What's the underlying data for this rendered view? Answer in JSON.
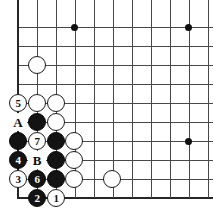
{
  "diagram": {
    "kind": "go-board-diagram",
    "board": {
      "origin_x": 18,
      "origin_y": 27,
      "spacing": 19,
      "cols": 11,
      "rows": 10,
      "left_edge_is_board_border": true,
      "bottom_edge_is_board_border": true,
      "line_color": "#484848",
      "edge_color": "#262626",
      "background_color": "#ffffff"
    },
    "star_points": [
      {
        "x": 74,
        "y": 27
      },
      {
        "x": 188,
        "y": 27
      },
      {
        "x": 188,
        "y": 141
      }
    ],
    "stones": [
      {
        "x": 37,
        "y": 65,
        "color": "white",
        "label": ""
      },
      {
        "x": 18,
        "y": 103,
        "color": "white",
        "label": "5"
      },
      {
        "x": 37,
        "y": 103,
        "color": "white",
        "label": ""
      },
      {
        "x": 56,
        "y": 103,
        "color": "white",
        "label": ""
      },
      {
        "x": 37,
        "y": 122,
        "color": "black",
        "label": ""
      },
      {
        "x": 56,
        "y": 122,
        "color": "white",
        "label": ""
      },
      {
        "x": 18,
        "y": 141,
        "color": "black",
        "label": ""
      },
      {
        "x": 37,
        "y": 141,
        "color": "white",
        "label": "7"
      },
      {
        "x": 56,
        "y": 141,
        "color": "black",
        "label": ""
      },
      {
        "x": 74,
        "y": 141,
        "color": "white",
        "label": ""
      },
      {
        "x": 18,
        "y": 160,
        "color": "black",
        "label": "4"
      },
      {
        "x": 56,
        "y": 160,
        "color": "black",
        "label": ""
      },
      {
        "x": 74,
        "y": 160,
        "color": "white",
        "label": ""
      },
      {
        "x": 18,
        "y": 179,
        "color": "white",
        "label": "3"
      },
      {
        "x": 37,
        "y": 179,
        "color": "black",
        "label": "6"
      },
      {
        "x": 56,
        "y": 179,
        "color": "black",
        "label": ""
      },
      {
        "x": 74,
        "y": 179,
        "color": "white",
        "label": ""
      },
      {
        "x": 112,
        "y": 179,
        "color": "white",
        "label": ""
      },
      {
        "x": 37,
        "y": 198,
        "color": "black",
        "label": "2"
      },
      {
        "x": 56,
        "y": 198,
        "color": "white",
        "label": "1"
      }
    ],
    "point_labels": [
      {
        "x": 18,
        "y": 122,
        "text": "A"
      },
      {
        "x": 37,
        "y": 160,
        "text": "B"
      }
    ],
    "move_sequence": [
      "1",
      "2",
      "3",
      "4",
      "5",
      "6",
      "7"
    ]
  }
}
